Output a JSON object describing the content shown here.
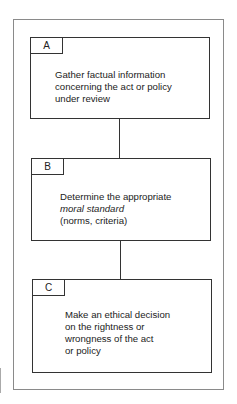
{
  "diagram": {
    "steps": [
      {
        "label": "A",
        "lines": [
          "Gather factual information",
          "concerning the act or policy",
          "under review"
        ]
      },
      {
        "label": "B",
        "lines": [
          "Determine the appropriate",
          "moral standard",
          "(norms, criteria)"
        ],
        "italic_line_index": 1
      },
      {
        "label": "C",
        "lines": [
          "Make an ethical decision",
          "on the rightness or",
          "wrongness of the act",
          "or policy"
        ]
      }
    ],
    "colors": {
      "box_border": "#333333",
      "frame_border": "#8a8a8a",
      "background": "#ffffff"
    }
  }
}
